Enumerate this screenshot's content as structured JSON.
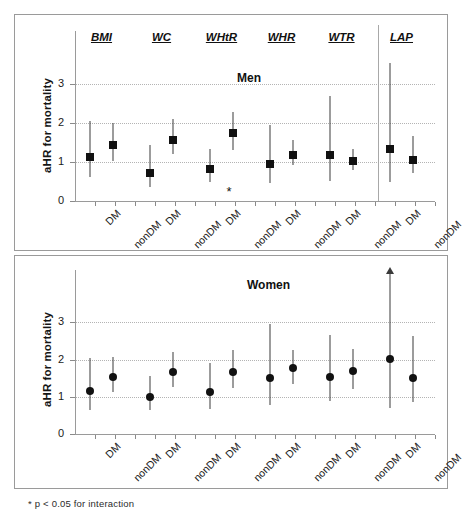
{
  "figure": {
    "footnote": "* p < 0.05 for interaction"
  },
  "chart_data": [
    {
      "type": "scatter",
      "title": "Men",
      "xlabel": "",
      "ylabel": "aHR for mortality",
      "ylim": [
        0,
        3.6
      ],
      "yticks": [
        0,
        1,
        2,
        3
      ],
      "gridlines": [
        1,
        2,
        3
      ],
      "grid": true,
      "legend": "none",
      "marker": "square",
      "groups": [
        "BMI",
        "WC",
        "WHtR",
        "WHR",
        "WTR",
        "LAP"
      ],
      "categories": [
        "DM",
        "nonDM"
      ],
      "points": [
        {
          "group": "BMI",
          "category": "DM",
          "value": 1.13,
          "ci_low": 0.61,
          "ci_high": 2.07,
          "significant_interaction": false
        },
        {
          "group": "BMI",
          "category": "nonDM",
          "value": 1.44,
          "ci_low": 1.04,
          "ci_high": 2.0,
          "significant_interaction": false
        },
        {
          "group": "WC",
          "category": "DM",
          "value": 0.72,
          "ci_low": 0.35,
          "ci_high": 1.45,
          "significant_interaction": false
        },
        {
          "group": "WC",
          "category": "nonDM",
          "value": 1.58,
          "ci_low": 1.2,
          "ci_high": 2.11,
          "significant_interaction": false
        },
        {
          "group": "WHtR",
          "category": "DM",
          "value": 0.82,
          "ci_low": 0.48,
          "ci_high": 1.34,
          "significant_interaction": false
        },
        {
          "group": "WHtR",
          "category": "nonDM",
          "value": 1.74,
          "ci_low": 1.31,
          "ci_high": 2.29,
          "significant_interaction": true
        },
        {
          "group": "WHR",
          "category": "DM",
          "value": 0.96,
          "ci_low": 0.45,
          "ci_high": 1.95,
          "significant_interaction": false
        },
        {
          "group": "WHR",
          "category": "nonDM",
          "value": 1.18,
          "ci_low": 0.92,
          "ci_high": 1.56,
          "significant_interaction": false
        },
        {
          "group": "WTR",
          "category": "DM",
          "value": 1.19,
          "ci_low": 0.52,
          "ci_high": 2.7,
          "significant_interaction": false
        },
        {
          "group": "WTR",
          "category": "nonDM",
          "value": 1.03,
          "ci_low": 0.8,
          "ci_high": 1.35,
          "significant_interaction": false
        },
        {
          "group": "LAP",
          "category": "DM",
          "value": 1.33,
          "ci_low": 0.48,
          "ci_high": 3.55,
          "significant_interaction": false
        },
        {
          "group": "LAP",
          "category": "nonDM",
          "value": 1.06,
          "ci_low": 0.72,
          "ci_high": 1.66,
          "significant_interaction": false
        }
      ]
    },
    {
      "type": "scatter",
      "title": "Women",
      "xlabel": "",
      "ylabel": "aHR for mortality",
      "ylim": [
        0,
        3.6
      ],
      "yticks": [
        0,
        1,
        2,
        3
      ],
      "gridlines": [
        1,
        2,
        3
      ],
      "grid": true,
      "legend": "none",
      "marker": "circle",
      "groups": [
        "BMI",
        "WC",
        "WHtR",
        "WHR",
        "WTR",
        "LAP"
      ],
      "categories": [
        "DM",
        "nonDM"
      ],
      "points": [
        {
          "group": "BMI",
          "category": "DM",
          "value": 1.15,
          "ci_low": 0.65,
          "ci_high": 2.05,
          "capped": false
        },
        {
          "group": "BMI",
          "category": "nonDM",
          "value": 1.53,
          "ci_low": 1.13,
          "ci_high": 2.06,
          "capped": false
        },
        {
          "group": "WC",
          "category": "DM",
          "value": 1.0,
          "ci_low": 0.64,
          "ci_high": 1.57,
          "capped": false
        },
        {
          "group": "WC",
          "category": "nonDM",
          "value": 1.67,
          "ci_low": 1.27,
          "ci_high": 2.21,
          "capped": false
        },
        {
          "group": "WHtR",
          "category": "DM",
          "value": 1.12,
          "ci_low": 0.68,
          "ci_high": 1.9,
          "capped": false
        },
        {
          "group": "WHtR",
          "category": "nonDM",
          "value": 1.67,
          "ci_low": 1.23,
          "ci_high": 2.25,
          "capped": false
        },
        {
          "group": "WHR",
          "category": "DM",
          "value": 1.5,
          "ci_low": 0.79,
          "ci_high": 2.95,
          "capped": false
        },
        {
          "group": "WHR",
          "category": "nonDM",
          "value": 1.76,
          "ci_low": 1.33,
          "ci_high": 2.27,
          "capped": false
        },
        {
          "group": "WTR",
          "category": "DM",
          "value": 1.53,
          "ci_low": 0.88,
          "ci_high": 2.66,
          "capped": false
        },
        {
          "group": "WTR",
          "category": "nonDM",
          "value": 1.68,
          "ci_low": 1.22,
          "ci_high": 2.28,
          "capped": false
        },
        {
          "group": "LAP",
          "category": "DM",
          "value": 2.01,
          "ci_low": 0.71,
          "ci_high": 3.8,
          "capped": true
        },
        {
          "group": "LAP",
          "category": "nonDM",
          "value": 1.5,
          "ci_low": 0.86,
          "ci_high": 2.64,
          "capped": false
        }
      ]
    }
  ]
}
